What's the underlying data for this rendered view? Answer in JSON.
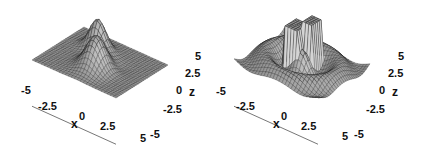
{
  "chart_data": [
    {
      "type": "surface3d",
      "title": "",
      "xlabel": "x",
      "zlabel": "z",
      "x_ticks": [
        "-5",
        "-2.5",
        "0",
        "2.5",
        "5"
      ],
      "z_ticks": [
        "5",
        "2.5",
        "0",
        "-2.5",
        "-5"
      ],
      "xlim": [
        -5,
        5
      ],
      "ylim": [
        -5,
        5
      ],
      "zlim": [
        -5,
        5
      ],
      "description": "Smooth surface with two elongated Gaussian-like ridges meeting near the center, one rising toward the back and one toward the front-left; gray shaded wireframe mesh",
      "grid": "mesh"
    },
    {
      "type": "surface3d",
      "title": "",
      "xlabel": "x",
      "zlabel": "z",
      "x_ticks": [
        "-5",
        "-2.5",
        "0",
        "2.5",
        "5"
      ],
      "z_ticks": [
        "5",
        "2.5",
        "0",
        "-2.5",
        "-5"
      ],
      "xlim": [
        -5,
        5
      ],
      "ylim": [
        -5,
        5
      ],
      "zlim": [
        -5,
        5
      ],
      "description": "Surface with clipped plateau blocks near the center and radial oscillating ripples around it; gray shaded wireframe mesh",
      "grid": "mesh"
    }
  ],
  "panels": [
    {
      "x_axis": {
        "label": "x",
        "ticks": [
          "-5",
          "-2.5",
          "0",
          "2.5",
          "5"
        ]
      },
      "z_axis": {
        "label": "z",
        "ticks": [
          "5",
          "2.5",
          "0",
          "-2.5",
          "-5"
        ]
      }
    },
    {
      "x_axis": {
        "label": "x",
        "ticks": [
          "-5",
          "-2.5",
          "0",
          "2.5",
          "5"
        ]
      },
      "z_axis": {
        "label": "z",
        "ticks": [
          "5",
          "2.5",
          "0",
          "-2.5",
          "-5"
        ]
      }
    }
  ],
  "colors": {
    "surface_light": "#d8d8d8",
    "surface_dark": "#2a2a2a",
    "mesh_line": "#1a1a1a",
    "axis_line": "#777777",
    "text": "#111111"
  }
}
